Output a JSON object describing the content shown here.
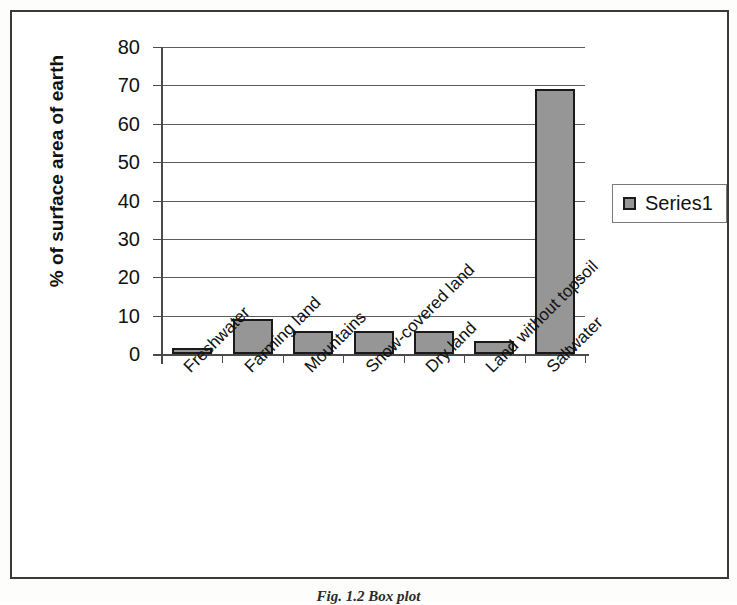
{
  "figure": {
    "caption": "Fig. 1.2 Box plot"
  },
  "legend": {
    "position": "right",
    "entries": [
      {
        "label": "Series1",
        "color": "#969696"
      }
    ]
  },
  "chart_data": {
    "type": "bar",
    "title": "",
    "xlabel": "",
    "ylabel": "% of surface area of earth",
    "categories": [
      "Freshwater",
      "Farming land",
      "Mountains",
      "Snow-covered land",
      "Dry land",
      "Land without topsoil",
      "Saltwater"
    ],
    "values": [
      1.5,
      9,
      6,
      6,
      6,
      3.5,
      69
    ],
    "series": [
      {
        "name": "Series1",
        "color": "#969696",
        "values": [
          1.5,
          9,
          6,
          6,
          6,
          3.5,
          69
        ]
      }
    ],
    "ylim": [
      0,
      80
    ],
    "yticks": [
      0,
      10,
      20,
      30,
      40,
      50,
      60,
      70,
      80
    ],
    "ytick_labels": [
      "0",
      "10",
      "20",
      "30",
      "40",
      "50",
      "60",
      "70",
      "80"
    ],
    "grid": "horizontal",
    "legend_position": "right",
    "bar_color": "#969696",
    "bar_edge_color": "#1a1a1a"
  }
}
